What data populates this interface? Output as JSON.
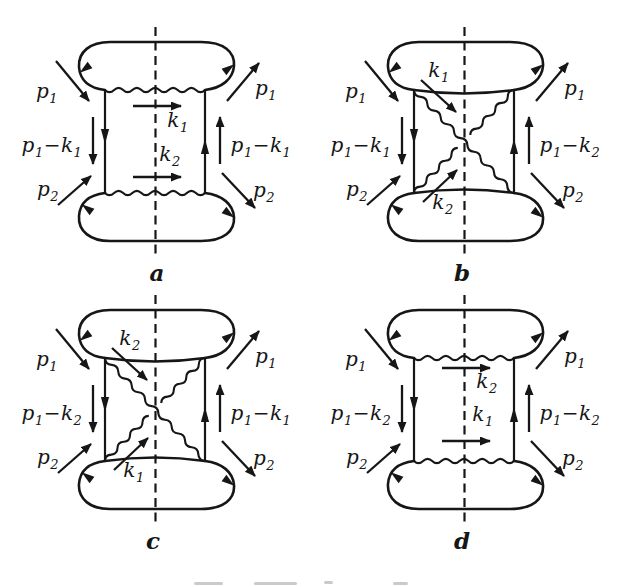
{
  "colors": {
    "ink": "#161616",
    "paper": "#ffffff"
  },
  "figure": {
    "panels": [
      {
        "caption": "a",
        "type": "ladder",
        "labels": {
          "p_in_top": "p_1",
          "p_out_top": "p_1",
          "prop_left": "p_1−k_1",
          "prop_right": "p_1−k_1",
          "p_in_bottom": "p_2",
          "p_out_bottom": "p_2",
          "k_upper": "k_1",
          "k_lower": "k_2"
        }
      },
      {
        "caption": "b",
        "type": "crossed",
        "labels": {
          "p_in_top": "p_1",
          "p_out_top": "p_1",
          "prop_left": "p_1−k_1",
          "prop_right": "p_1−k_2",
          "p_in_bottom": "p_2",
          "p_out_bottom": "p_2",
          "k_upper": "k_1",
          "k_lower": "k_2"
        }
      },
      {
        "caption": "c",
        "type": "crossed",
        "labels": {
          "p_in_top": "p_1",
          "p_out_top": "p_1",
          "prop_left": "p_1−k_2",
          "prop_right": "p_1−k_1",
          "p_in_bottom": "p_2",
          "p_out_bottom": "p_2",
          "k_upper": "k_2",
          "k_lower": "k_1"
        }
      },
      {
        "caption": "d",
        "type": "ladder",
        "labels": {
          "p_in_top": "p_1",
          "p_out_top": "p_1",
          "prop_left": "p_1−k_2",
          "prop_right": "p_1−k_2",
          "p_in_bottom": "p_2",
          "p_out_bottom": "p_2",
          "k_upper": "k_2",
          "k_lower": "k_1"
        }
      }
    ]
  }
}
